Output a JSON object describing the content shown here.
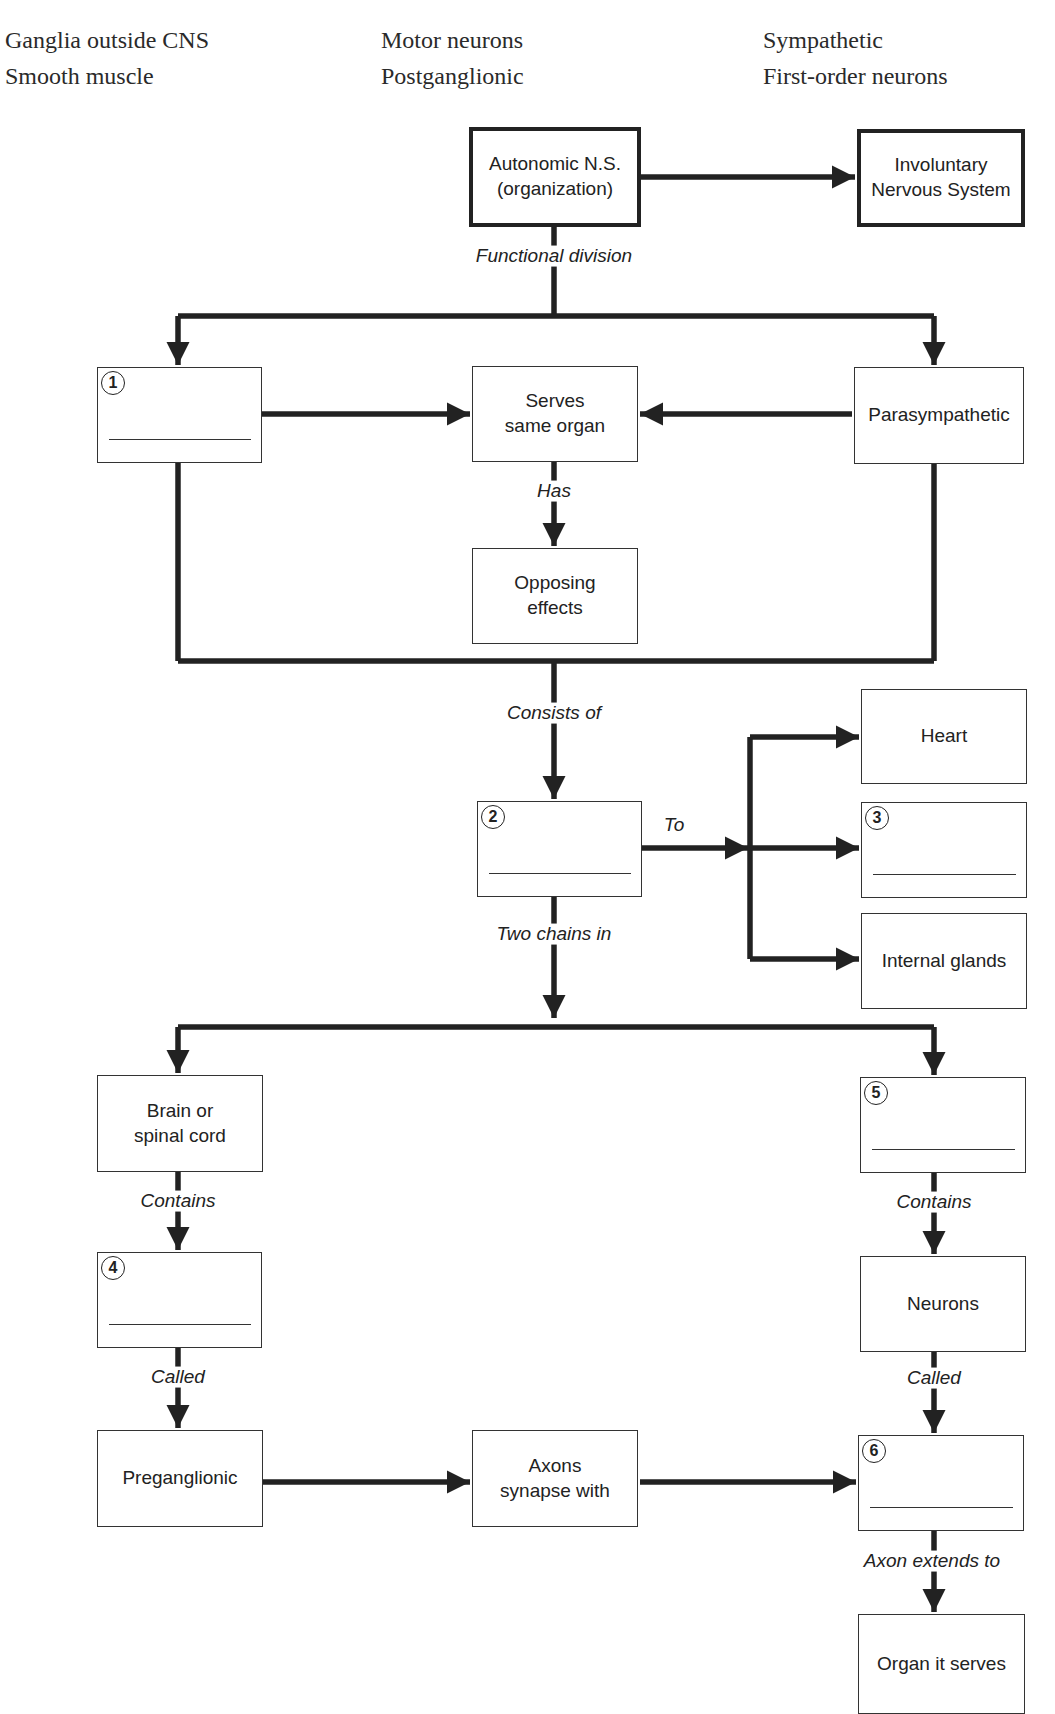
{
  "header": {
    "cut_off_line": "...py... ...g... ...p..."
  },
  "word_bank": {
    "col1": [
      "Ganglia outside CNS",
      "Smooth muscle"
    ],
    "col2": [
      "Motor neurons",
      "Postganglionic"
    ],
    "col3": [
      "Sympathetic",
      "First-order neurons"
    ]
  },
  "nodes": {
    "autonomic": "Autonomic N.S. (organization)",
    "involuntary": "Involuntary Nervous System",
    "blank1": {
      "number": "1",
      "value": ""
    },
    "serves_same_organ": "Serves same organ",
    "parasympathetic": "Parasympathetic",
    "opposing_effects": "Opposing effects",
    "blank2": {
      "number": "2",
      "value": ""
    },
    "heart": "Heart",
    "blank3": {
      "number": "3",
      "value": ""
    },
    "internal_glands": "Internal glands",
    "brain_spinal": "Brain or spinal cord",
    "blank5": {
      "number": "5",
      "value": ""
    },
    "blank4": {
      "number": "4",
      "value": ""
    },
    "neurons": "Neurons",
    "preganglionic": "Preganglionic",
    "axons_synapse": "Axons synapse with",
    "blank6": {
      "number": "6",
      "value": ""
    },
    "organ_it_serves": "Organ it serves"
  },
  "edges": {
    "functional_division": "Functional division",
    "has": "Has",
    "consists_of": "Consists of",
    "to": "To",
    "two_chains_in": "Two chains in",
    "contains_left": "Contains",
    "contains_right": "Contains",
    "called_left": "Called",
    "called_right": "Called",
    "axon_extends_to": "Axon extends to"
  },
  "colors": {
    "line": "#222222",
    "border": "#333333",
    "background": "#ffffff"
  }
}
